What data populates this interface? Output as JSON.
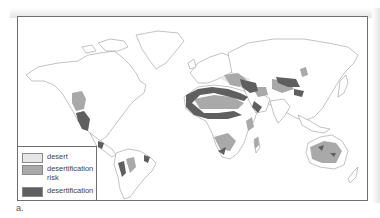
{
  "map": {
    "title": "",
    "legend": {
      "items": [
        {
          "label": "desert",
          "color": "#e6e6e6"
        },
        {
          "label": "desertification risk",
          "color": "#a9a9a9"
        },
        {
          "label": "desertification",
          "color": "#5f5f5f"
        }
      ]
    },
    "caption": "a.",
    "colors": {
      "land": "#ffffff",
      "coastline": "#9a9a9a",
      "frame": "#6f6f6f"
    }
  }
}
